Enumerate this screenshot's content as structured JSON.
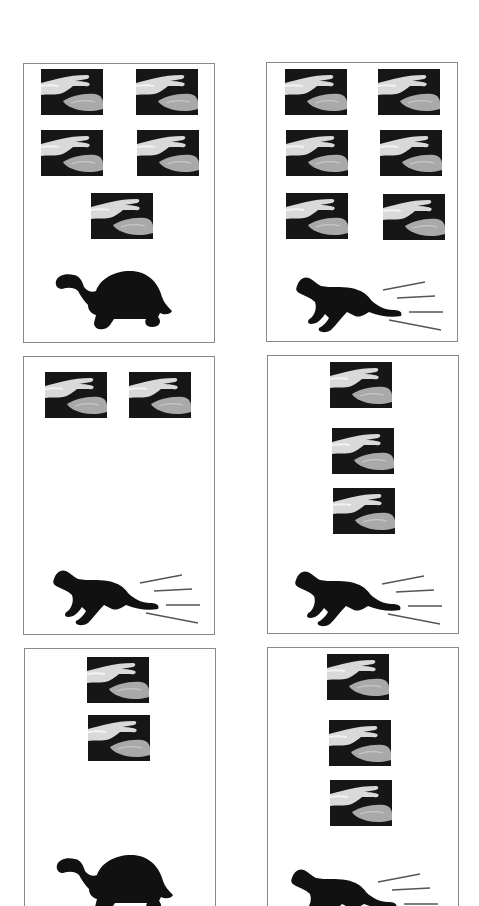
{
  "figure": {
    "colors": {
      "panel_border": "#8a8a8a",
      "silhouette": "#111111",
      "hand_bg": "#1a1a1a",
      "speed_lines": "#555555"
    },
    "panels": [
      {
        "id": 1,
        "row": 1,
        "col": 1,
        "hand_count": 5,
        "animal": "tortoise",
        "speed": "slow"
      },
      {
        "id": 2,
        "row": 1,
        "col": 2,
        "hand_count": 6,
        "animal": "cat",
        "speed": "fast"
      },
      {
        "id": 3,
        "row": 2,
        "col": 1,
        "hand_count": 2,
        "animal": "cat",
        "speed": "fast"
      },
      {
        "id": 4,
        "row": 2,
        "col": 2,
        "hand_count": 3,
        "animal": "cat",
        "speed": "fast"
      },
      {
        "id": 5,
        "row": 3,
        "col": 1,
        "hand_count": 2,
        "animal": "tortoise",
        "speed": "slow"
      },
      {
        "id": 6,
        "row": 3,
        "col": 2,
        "hand_count": 3,
        "animal": "cat",
        "speed": "fast"
      }
    ]
  }
}
